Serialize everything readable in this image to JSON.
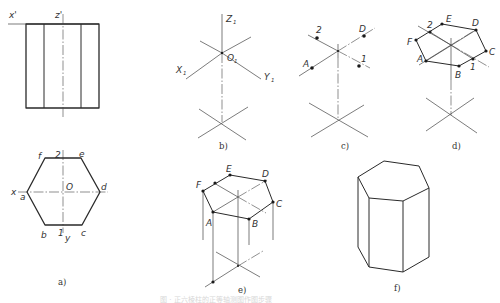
{
  "figure": {
    "caption_faint": "图 · 正六棱柱的正等轴测图作图步骤",
    "panels": {
      "a": {
        "caption": "a)",
        "front_view_labels": {
          "x_prime": "x'",
          "z_prime": "z'"
        },
        "top_view_labels": {
          "x": "x",
          "y": "y",
          "origin": "O",
          "a": "a",
          "b": "b",
          "c": "c",
          "d": "d",
          "e": "e",
          "f": "f",
          "p1": "1",
          "p2": "2"
        }
      },
      "b": {
        "caption": "b)",
        "axis_labels": {
          "z": "Z",
          "x": "X",
          "y": "Y",
          "o": "O",
          "sub": "1"
        }
      },
      "c": {
        "caption": "c)",
        "points": {
          "A": "A",
          "D": "D",
          "p1": "1",
          "p2": "2"
        }
      },
      "d": {
        "caption": "d)",
        "points": {
          "A": "A",
          "B": "B",
          "C": "C",
          "D": "D",
          "E": "E",
          "F": "F",
          "p1": "1",
          "p2": "2"
        }
      },
      "e": {
        "caption": "e)",
        "points": {
          "A": "A",
          "B": "B",
          "C": "C",
          "D": "D",
          "E": "E",
          "F": "F"
        }
      },
      "f": {
        "caption": "f)"
      }
    }
  }
}
